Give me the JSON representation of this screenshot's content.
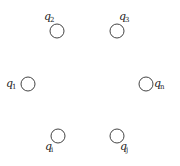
{
  "diagram": {
    "type": "node-set",
    "background": "#ffffff",
    "stroke_color": "#444444",
    "nodes": [
      {
        "id": "q2",
        "base": "q",
        "sub": "2",
        "cx": 57,
        "cy": 31,
        "r": 7,
        "label_x": 44,
        "label_y": 20,
        "sub_dx": 6,
        "sub_dy": 2
      },
      {
        "id": "q3",
        "base": "q",
        "sub": "3",
        "cx": 117,
        "cy": 31,
        "r": 7,
        "label_x": 119,
        "label_y": 20,
        "sub_dx": 6,
        "sub_dy": 2
      },
      {
        "id": "q1",
        "base": "q",
        "sub": "1",
        "cx": 28,
        "cy": 84,
        "r": 7,
        "label_x": 6,
        "label_y": 87,
        "sub_dx": 6,
        "sub_dy": 2
      },
      {
        "id": "qn",
        "base": "q",
        "sub": "n",
        "cx": 146,
        "cy": 84,
        "r": 7,
        "label_x": 154,
        "label_y": 87,
        "sub_dx": 6,
        "sub_dy": 2
      },
      {
        "id": "qi",
        "base": "q",
        "sub": "i",
        "cx": 58,
        "cy": 136,
        "r": 7,
        "label_x": 45,
        "label_y": 150,
        "sub_dx": 6,
        "sub_dy": 2
      },
      {
        "id": "qj",
        "base": "q",
        "sub": "j",
        "cx": 117,
        "cy": 136,
        "r": 7,
        "label_x": 120,
        "label_y": 150,
        "sub_dx": 6,
        "sub_dy": 2
      }
    ]
  }
}
